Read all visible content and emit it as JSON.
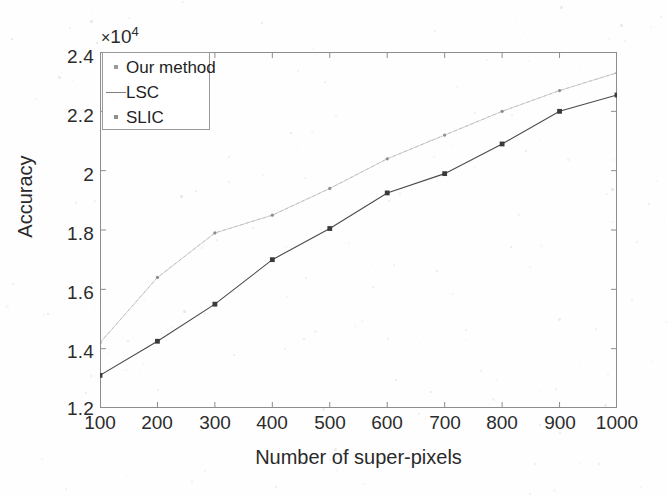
{
  "chart_data": {
    "type": "line",
    "title": "",
    "xlabel": "Number of super-pixels",
    "ylabel": "Accuracy",
    "y_multiplier": "×10",
    "y_multiplier_exponent": "4",
    "x": [
      100,
      200,
      300,
      400,
      500,
      600,
      700,
      800,
      900,
      1000
    ],
    "xticks": [
      "100",
      "200",
      "300",
      "400",
      "500",
      "600",
      "700",
      "800",
      "900",
      "1000"
    ],
    "yticks": [
      "1.2",
      "1.4",
      "1.6",
      "1.8",
      "2",
      "2.2",
      "2.4"
    ],
    "xlim": [
      100,
      1000
    ],
    "ylim": [
      1.2,
      2.4
    ],
    "grid": false,
    "legend_position": "top-left",
    "series": [
      {
        "name": "Our method",
        "color": "#b9b9b9",
        "marker": "dot",
        "values": [
          1.42,
          1.64,
          1.79,
          1.85,
          1.94,
          2.04,
          2.12,
          2.2,
          2.27,
          2.33
        ]
      },
      {
        "name": "LSC",
        "color": "#9d9d9d",
        "marker": "dash",
        "values": [
          1.42,
          1.64,
          1.79,
          1.85,
          1.94,
          2.04,
          2.12,
          2.2,
          2.27,
          2.33
        ]
      },
      {
        "name": "SLIC",
        "color": "#4a4a4a",
        "marker": "square",
        "values": [
          1.31,
          1.425,
          1.55,
          1.7,
          1.805,
          1.925,
          1.99,
          2.09,
          2.2,
          2.255
        ]
      }
    ]
  },
  "legend": {
    "items": [
      {
        "label": "Our method"
      },
      {
        "label": "LSC"
      },
      {
        "label": "SLIC"
      }
    ]
  },
  "axes": {
    "x_title": "Number of super-pixels",
    "y_title": "Accuracy"
  }
}
